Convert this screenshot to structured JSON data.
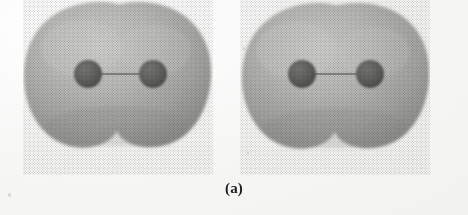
{
  "figure": {
    "caption": "(a)",
    "kind": "electron-density-isosurface-diagram",
    "background_color": "#f7f7f6",
    "molecules": [
      {
        "id": "molecule-left",
        "label": "diatomic-molecule-left",
        "surface_color": "#a9a9a6",
        "surface_highlight_color": "#c9c9c6",
        "surface_shadow_color": "#8d8d8a",
        "atoms": [
          {
            "name": "atom-left",
            "cx": 65,
            "cy": 74,
            "r": 14,
            "color": "#5e5e5c"
          },
          {
            "name": "atom-right",
            "cx": 130,
            "cy": 74,
            "r": 14,
            "color": "#5e5e5c"
          }
        ],
        "bond": {
          "name": "bond-line",
          "x1": 65,
          "y1": 74,
          "x2": 130,
          "y2": 74,
          "color": "#6e6e6c",
          "width": 1.4
        }
      },
      {
        "id": "molecule-right",
        "label": "diatomic-molecule-right",
        "surface_color": "#a9a9a6",
        "surface_highlight_color": "#c9c9c6",
        "surface_shadow_color": "#8d8d8a",
        "atoms": [
          {
            "name": "atom-left",
            "cx": 62,
            "cy": 74,
            "r": 14,
            "color": "#5e5e5c"
          },
          {
            "name": "atom-right",
            "cx": 130,
            "cy": 74,
            "r": 14,
            "color": "#5e5e5c"
          }
        ],
        "bond": {
          "name": "bond-line",
          "x1": 62,
          "y1": 74,
          "x2": 130,
          "y2": 74,
          "color": "#6e6e6c",
          "width": 1.4
        }
      }
    ],
    "flecks": [
      {
        "left": 30,
        "top": 47,
        "w": 2,
        "h": 2
      },
      {
        "left": 243,
        "top": 47,
        "w": 2,
        "h": 3
      },
      {
        "left": 247,
        "top": 152,
        "w": 2,
        "h": 2
      },
      {
        "left": 8,
        "top": 193,
        "w": 3,
        "h": 4
      }
    ]
  }
}
